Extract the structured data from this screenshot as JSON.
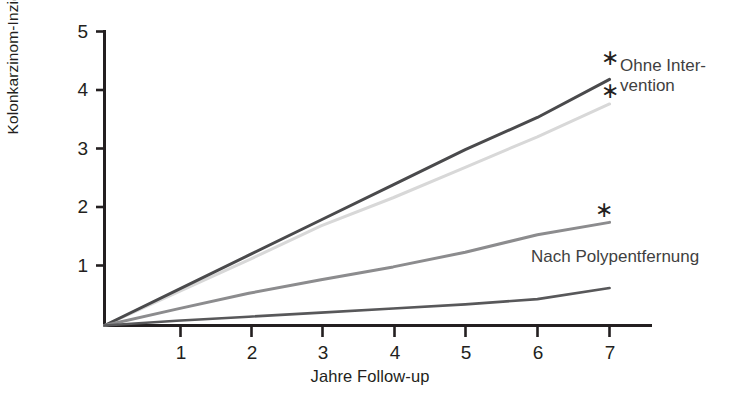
{
  "chart_data": {
    "type": "line",
    "title": "",
    "subtitle": "",
    "xlabel": "Jahre Follow-up",
    "ylabel_line1": "Prozent der kumulativen",
    "ylabel_line2": "Kolonkarzinom-Inzidenz",
    "ylabel": "Prozent der kumulativen Kolonkarzinom-Inzidenz",
    "x": [
      0,
      1,
      2,
      3,
      4,
      5,
      6,
      7
    ],
    "xlim": [
      0,
      7.4
    ],
    "ylim": [
      0,
      5
    ],
    "xticks": [
      1,
      2,
      3,
      4,
      5,
      6,
      7
    ],
    "xtick_labels": [
      "1",
      "2",
      "3",
      "4",
      "5",
      "6",
      "7"
    ],
    "yticks": [
      1,
      2,
      3,
      4,
      5
    ],
    "ytick_labels": [
      "1",
      "2",
      "3",
      "4",
      "5"
    ],
    "grid": false,
    "legend_position": "inline-right",
    "series": [
      {
        "name": "Ohne Intervention (obere Kurve)",
        "color": "#4a4a4c",
        "linewidth": 3.0,
        "values": [
          0.0,
          0.6,
          1.2,
          1.8,
          2.4,
          3.0,
          3.55,
          4.2
        ],
        "endpoint_value": 4.2,
        "annotation": "*"
      },
      {
        "name": "Ohne Intervention (untere Kurve)",
        "color": "#d8d8d8",
        "linewidth": 3.0,
        "values": [
          0.0,
          0.56,
          1.12,
          1.7,
          2.18,
          2.7,
          3.22,
          3.78
        ],
        "endpoint_value": 3.78,
        "annotation": "*"
      },
      {
        "name": "Nach Polypentfernung (obere Kurve)",
        "color": "#8c8c8e",
        "linewidth": 3.0,
        "values": [
          0.0,
          0.28,
          0.55,
          0.78,
          1.0,
          1.25,
          1.55,
          1.76
        ],
        "endpoint_value": 1.76,
        "annotation": "*"
      },
      {
        "name": "Nach Polypentfernung (untere Kurve)",
        "color": "#58585a",
        "linewidth": 2.6,
        "values": [
          0.0,
          0.08,
          0.15,
          0.22,
          0.29,
          0.36,
          0.45,
          0.64
        ],
        "endpoint_value": 0.64,
        "annotation": ""
      }
    ],
    "annotations": [
      {
        "text": "Ohne Inter-",
        "line2": "vention",
        "target": "upper group"
      },
      {
        "text": "Nach Polypentfernung",
        "target": "lower group"
      },
      {
        "text": "*",
        "count": 3,
        "meaning": "signifikant"
      }
    ]
  },
  "labels": {
    "series_upper_line1": "Ohne Inter-",
    "series_upper_line2": "vention",
    "series_lower": "Nach Polypentfernung",
    "star": "∗"
  },
  "axes": {
    "x_title": "Jahre Follow-up",
    "y_title_line1": "Prozent der kumulativen",
    "y_title_line2": "Kolonkarzinom-Inzidenz",
    "x_tick_1": "1",
    "x_tick_2": "2",
    "x_tick_3": "3",
    "x_tick_4": "4",
    "x_tick_5": "5",
    "x_tick_6": "6",
    "x_tick_7": "7",
    "y_tick_1": "1",
    "y_tick_2": "2",
    "y_tick_3": "3",
    "y_tick_4": "4",
    "y_tick_5": "5"
  },
  "colors": {
    "axis": "#231f20",
    "text": "#231f20",
    "series_1": "#4a4a4c",
    "series_2": "#d8d8d8",
    "series_3": "#8c8c8e",
    "series_4": "#58585a",
    "background": "#ffffff"
  }
}
